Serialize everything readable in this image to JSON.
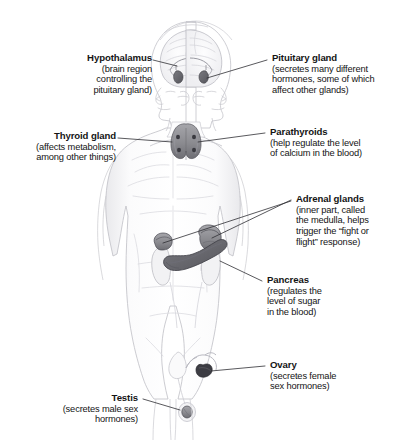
{
  "figure": {
    "style": "pencil-sketch anatomical illustration",
    "background_color": "#ffffff",
    "text_color": "#141414",
    "leader_line_color": "#2a2a2a",
    "organ_fill_color": "#8e8e93",
    "organ_dark_color": "#4a4a4f",
    "body_sketch_color": "#c9c9cd"
  },
  "callouts": [
    {
      "id": "hypothalamus",
      "title": "Hypothalamus",
      "desc": "(brain region\ncontrolling the\npituitary gland)",
      "side": "left"
    },
    {
      "id": "pituitary-gland",
      "title": "Pituitary gland",
      "desc": "(secretes many different\nhormones, some of which\naffect other glands)",
      "side": "right"
    },
    {
      "id": "thyroid-gland",
      "title": "Thyroid gland",
      "desc": "(affects metabolism,\namong other things)",
      "side": "left"
    },
    {
      "id": "parathyroids",
      "title": "Parathyroids",
      "desc": "(help regulate the level\nof calcium in the blood)",
      "side": "right"
    },
    {
      "id": "adrenal-glands",
      "title": "Adrenal glands",
      "desc": "(inner part, called\nthe medulla, helps\ntrigger the “fight or\nflight” response)",
      "side": "right"
    },
    {
      "id": "pancreas",
      "title": "Pancreas",
      "desc": "(regulates the\nlevel of sugar\nin the blood)",
      "side": "right"
    },
    {
      "id": "ovary",
      "title": "Ovary",
      "desc": "(secretes female\nsex hormones)",
      "side": "right"
    },
    {
      "id": "testis",
      "title": "Testis",
      "desc": "(secretes male sex\nhormones)",
      "side": "left"
    }
  ],
  "organs": [
    {
      "id": "pituitary-left",
      "label": "pituitary gland (left profile)"
    },
    {
      "id": "pituitary-right",
      "label": "pituitary gland (right profile)"
    },
    {
      "id": "thyroid",
      "label": "thyroid gland"
    },
    {
      "id": "parathyroid-dots",
      "label": "parathyroid glands"
    },
    {
      "id": "adrenal-left",
      "label": "adrenal gland on left kidney"
    },
    {
      "id": "adrenal-right",
      "label": "adrenal gland on right kidney"
    },
    {
      "id": "pancreas-organ",
      "label": "pancreas"
    },
    {
      "id": "ovary-organ",
      "label": "ovary"
    },
    {
      "id": "testis-organ",
      "label": "testis"
    }
  ]
}
